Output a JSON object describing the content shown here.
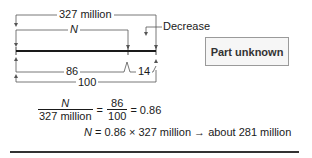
{
  "diagram": {
    "top_brackets": {
      "whole_label": "327 million",
      "part_label": "N"
    },
    "bottom_brackets": {
      "part_label": "86",
      "remainder_label": "14",
      "whole_label": "100"
    },
    "callout": {
      "label": "Decrease"
    },
    "box": {
      "label": "Part unknown"
    }
  },
  "equations": {
    "line1": {
      "frac1_num": "N",
      "frac1_den": "327 million",
      "equals1": "=",
      "frac2_num": "86",
      "frac2_den": "100",
      "result": "= 0.86"
    },
    "line2": {
      "lhs": "N",
      "rhs": " = 0.86 × 327 million → about 281 million"
    }
  },
  "colors": {
    "line": "#1a1a1a",
    "bracket": "#555555",
    "box_border": "#9a9a9a",
    "box_fill": "#f6f6f6"
  }
}
